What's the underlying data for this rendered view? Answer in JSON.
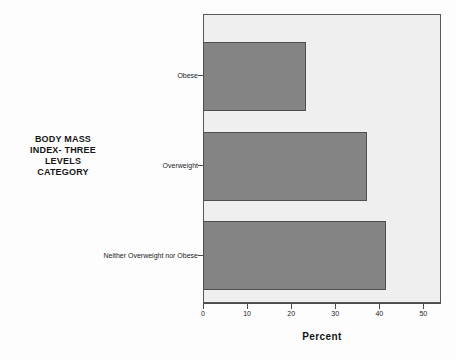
{
  "chart_data": {
    "type": "bar",
    "orientation": "horizontal",
    "title": "",
    "xlabel": "Percent",
    "ylabel": "BODY MASS INDEX- THREE LEVELS CATEGORY",
    "ylabel_lines": [
      "BODY MASS",
      "INDEX- THREE",
      "LEVELS",
      "CATEGORY"
    ],
    "categories": [
      "Neither Overweight nor Obese",
      "Overweight",
      "Obese"
    ],
    "values": [
      41.4,
      37.0,
      23.2
    ],
    "xlim": [
      0,
      54
    ],
    "xticks": [
      0,
      10,
      20,
      30,
      40,
      50
    ],
    "xtick_labels": [
      "0",
      "10",
      "20",
      "30",
      "40",
      "50"
    ],
    "grid": false,
    "legend": "none",
    "bar_color": "#848484",
    "bar_edge_color": "#4f4f4f",
    "plot_background": "#efefef",
    "frame_color": "#595959",
    "bars": [
      {
        "category": "Obese",
        "value": 23.2
      },
      {
        "category": "Overweight",
        "value": 37.0
      },
      {
        "category": "Neither Overweight nor Obese",
        "value": 41.4
      }
    ]
  }
}
